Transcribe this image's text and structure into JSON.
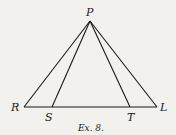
{
  "diagram": {
    "caption": "Ex. 8.",
    "points": {
      "P": {
        "label": "P",
        "x": 90,
        "y": 21
      },
      "R": {
        "label": "R",
        "x": 24,
        "y": 107
      },
      "S": {
        "label": "S",
        "x": 52,
        "y": 107
      },
      "T": {
        "label": "T",
        "x": 130,
        "y": 107
      },
      "L": {
        "label": "L",
        "x": 157,
        "y": 107
      }
    },
    "segments": [
      "PR",
      "PS",
      "PT",
      "PL",
      "RL"
    ],
    "colors": {
      "ink": "#1a1a1a",
      "background": "#f2f1ee"
    }
  }
}
